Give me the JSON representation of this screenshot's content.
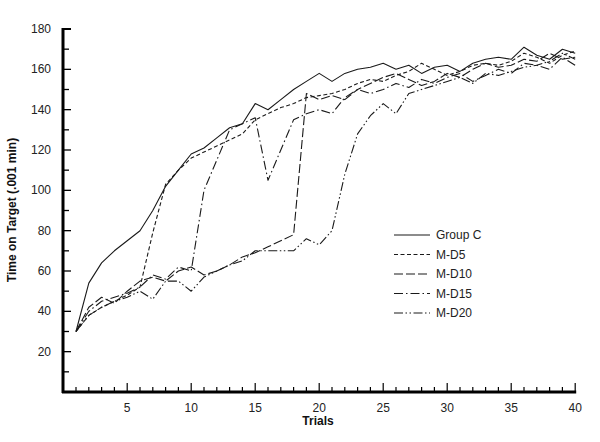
{
  "chart_data": {
    "type": "line",
    "title": "",
    "xlabel": "Trials",
    "ylabel": "Time on Target (.001 min)",
    "xlim": [
      0,
      40
    ],
    "ylim": [
      0,
      180
    ],
    "x_ticks": [
      5,
      10,
      15,
      20,
      25,
      30,
      35,
      40
    ],
    "y_ticks": [
      20,
      40,
      60,
      80,
      100,
      120,
      140,
      160,
      180
    ],
    "grid": false,
    "legend_position": "center-right",
    "series": [
      {
        "name": "Group C",
        "dash": "solid",
        "x": [
          1,
          2,
          3,
          4,
          5,
          6,
          7,
          8,
          9,
          10,
          11,
          12,
          13,
          14,
          15,
          16,
          17,
          18,
          19,
          20,
          21,
          22,
          23,
          24,
          25,
          26,
          27,
          28,
          29,
          30,
          31,
          32,
          33,
          34,
          35,
          36,
          37,
          38,
          39,
          40
        ],
        "values": [
          30,
          54,
          64,
          70,
          75,
          80,
          90,
          102,
          110,
          118,
          121,
          126,
          131,
          133,
          143,
          140,
          145,
          150,
          154,
          158,
          154,
          158,
          160,
          161,
          163,
          160,
          162,
          158,
          161,
          162,
          159,
          163,
          165,
          166,
          165,
          171,
          167,
          165,
          170,
          168
        ]
      },
      {
        "name": "M-D5",
        "dash": "short-dash",
        "x": [
          1,
          2,
          3,
          4,
          5,
          6,
          7,
          8,
          9,
          10,
          11,
          12,
          13,
          14,
          15,
          16,
          17,
          18,
          19,
          20,
          21,
          22,
          23,
          24,
          25,
          26,
          27,
          28,
          29,
          30,
          31,
          32,
          33,
          34,
          35,
          36,
          37,
          38,
          39,
          40
        ],
        "values": [
          30,
          38,
          42,
          45,
          48,
          52,
          79,
          103,
          110,
          116,
          119,
          122,
          125,
          128,
          135,
          138,
          141,
          143,
          146,
          147,
          148,
          150,
          153,
          155,
          154,
          157,
          159,
          163,
          160,
          157,
          159,
          162,
          163,
          162,
          164,
          168,
          166,
          163,
          167,
          169
        ]
      },
      {
        "name": "M-D10",
        "dash": "long-dash",
        "x": [
          1,
          2,
          3,
          4,
          5,
          6,
          7,
          8,
          9,
          10,
          11,
          12,
          13,
          14,
          15,
          16,
          17,
          18,
          19,
          20,
          21,
          22,
          23,
          24,
          25,
          26,
          27,
          28,
          29,
          30,
          31,
          32,
          33,
          34,
          35,
          36,
          37,
          38,
          39,
          40
        ],
        "values": [
          30,
          42,
          47,
          44,
          50,
          55,
          57,
          55,
          60,
          62,
          58,
          60,
          63,
          67,
          69,
          72,
          75,
          78,
          148,
          145,
          147,
          145,
          150,
          153,
          156,
          158,
          155,
          152,
          154,
          158,
          156,
          160,
          163,
          161,
          162,
          165,
          164,
          168,
          165,
          166
        ]
      },
      {
        "name": "M-D15",
        "dash": "dash-dot",
        "x": [
          1,
          2,
          3,
          4,
          5,
          6,
          7,
          8,
          9,
          10,
          11,
          12,
          13,
          14,
          15,
          16,
          17,
          18,
          19,
          20,
          21,
          22,
          23,
          24,
          25,
          26,
          27,
          28,
          29,
          30,
          31,
          32,
          33,
          34,
          35,
          36,
          37,
          38,
          39,
          40
        ],
        "values": [
          30,
          40,
          45,
          47,
          49,
          52,
          58,
          56,
          62,
          60,
          100,
          115,
          130,
          133,
          136,
          105,
          120,
          135,
          138,
          140,
          138,
          146,
          150,
          148,
          150,
          153,
          151,
          155,
          153,
          156,
          158,
          154,
          157,
          160,
          158,
          163,
          162,
          160,
          166,
          162
        ]
      },
      {
        "name": "M-D20",
        "dash": "dash-dot-dot",
        "x": [
          1,
          2,
          3,
          4,
          5,
          6,
          7,
          8,
          9,
          10,
          11,
          12,
          13,
          14,
          15,
          16,
          17,
          18,
          19,
          20,
          21,
          22,
          23,
          24,
          25,
          26,
          27,
          28,
          29,
          30,
          31,
          32,
          33,
          34,
          35,
          36,
          37,
          38,
          39,
          40
        ],
        "values": [
          30,
          38,
          42,
          45,
          47,
          50,
          46,
          55,
          55,
          50,
          57,
          60,
          63,
          65,
          70,
          70,
          70,
          70,
          76,
          73,
          80,
          108,
          128,
          137,
          143,
          138,
          148,
          150,
          152,
          154,
          156,
          153,
          158,
          157,
          159,
          161,
          162,
          164,
          168,
          165
        ]
      }
    ]
  },
  "legend": {
    "items": [
      {
        "label": "Group C",
        "dash": "solid"
      },
      {
        "label": "M-D5",
        "dash": "short-dash"
      },
      {
        "label": "M-D10",
        "dash": "long-dash"
      },
      {
        "label": "M-D15",
        "dash": "dash-dot"
      },
      {
        "label": "M-D20",
        "dash": "dash-dot-dot"
      }
    ]
  },
  "colors": {
    "line": "#1a1a1a",
    "axis": "#000000",
    "background": "#ffffff"
  }
}
